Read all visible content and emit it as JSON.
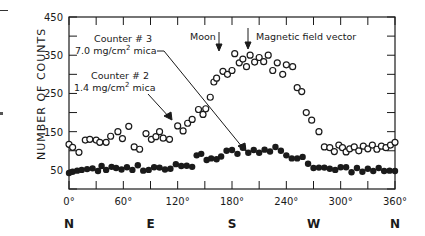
{
  "chart_data": {
    "type": "scatter",
    "title": "",
    "xlabel": "",
    "ylabel": "NUMBER OF COUNTS",
    "xlim": [
      0,
      360
    ],
    "ylim": [
      0,
      450
    ],
    "x_ticks": [
      "0°",
      "60°",
      "120°",
      "180°",
      "240°",
      "300°",
      "360°"
    ],
    "y_ticks": [
      "50",
      "150",
      "250",
      "350",
      "450"
    ],
    "compass_labels": [
      {
        "label": "N",
        "deg": 0
      },
      {
        "label": "E",
        "deg": 90
      },
      {
        "label": "S",
        "deg": 180
      },
      {
        "label": "W",
        "deg": 270
      },
      {
        "label": "N",
        "deg": 360
      }
    ],
    "grid": false,
    "series": [
      {
        "name": "Counter #2 1.4 mg/cm² mica",
        "marker": "open-circle",
        "x": [
          0,
          4,
          11,
          18,
          23,
          30,
          34,
          41,
          46,
          54,
          59,
          66,
          72,
          78,
          85,
          91,
          96,
          100,
          104,
          111,
          120,
          126,
          131,
          136,
          143,
          148,
          151,
          156,
          160,
          163,
          170,
          175,
          180,
          183,
          188,
          192,
          196,
          200,
          205,
          210,
          215,
          220,
          225,
          230,
          236,
          240,
          247,
          252,
          257,
          262,
          268,
          276,
          282,
          288,
          293,
          298,
          302,
          306,
          310,
          315,
          320,
          325,
          330,
          335,
          340,
          345,
          350,
          355,
          360
        ],
        "y": [
          117,
          109,
          96,
          128,
          130,
          128,
          122,
          122,
          138,
          150,
          132,
          164,
          110,
          104,
          145,
          130,
          137,
          150,
          133,
          130,
          165,
          152,
          172,
          182,
          208,
          195,
          210,
          240,
          280,
          290,
          308,
          300,
          310,
          354,
          330,
          340,
          320,
          350,
          332,
          344,
          333,
          350,
          310,
          330,
          300,
          325,
          320,
          265,
          255,
          200,
          180,
          150,
          110,
          108,
          98,
          115,
          108,
          97,
          105,
          110,
          100,
          112,
          105,
          115,
          104,
          112,
          108,
          115,
          122
        ]
      },
      {
        "name": "Counter #3 7.0 mg/cm² mica",
        "marker": "filled-circle",
        "x": [
          0,
          4,
          9,
          14,
          20,
          26,
          32,
          36,
          41,
          47,
          52,
          58,
          64,
          70,
          76,
          82,
          88,
          94,
          100,
          106,
          112,
          118,
          124,
          130,
          136,
          141,
          146,
          152,
          157,
          163,
          168,
          174,
          180,
          186,
          192,
          198,
          204,
          210,
          216,
          222,
          228,
          234,
          240,
          246,
          252,
          258,
          264,
          270,
          276,
          282,
          288,
          294,
          300,
          306,
          312,
          318,
          324,
          330,
          336,
          342,
          348,
          354,
          360
        ],
        "y": [
          42,
          45,
          48,
          50,
          52,
          54,
          47,
          60,
          50,
          58,
          55,
          51,
          57,
          50,
          62,
          48,
          50,
          57,
          56,
          51,
          53,
          65,
          60,
          61,
          58,
          88,
          92,
          76,
          80,
          78,
          85,
          100,
          102,
          92,
          108,
          95,
          102,
          95,
          103,
          98,
          110,
          100,
          88,
          80,
          80,
          84,
          66,
          55,
          56,
          56,
          53,
          50,
          57,
          57,
          44,
          55,
          45,
          53,
          47,
          55,
          47,
          48,
          47
        ]
      }
    ],
    "annotations": [
      {
        "text": "Counter # 3",
        "line2": "7.0 mg/cm² mica",
        "points_to_deg": 192
      },
      {
        "text": "Counter # 2",
        "line2": "1.4 mg/cm² mica",
        "points_to_deg": 120
      },
      {
        "text": "Moon",
        "arrow_deg": 165
      },
      {
        "text": "Magnetic field vector",
        "arrow_deg": 195
      }
    ]
  },
  "labels": {
    "ylabel": "NUMBER OF COUNTS",
    "c3_line1": "Counter # 3",
    "c3_line2a": "7.0 mg/cm",
    "c3_sup": "2",
    "c3_line2b": " mica",
    "c2_line1": "Counter # 2",
    "c2_line2a": "1.4 mg/cm",
    "c2_sup": "2",
    "c2_line2b": " mica",
    "moon": "Moon",
    "mag": "Magnetic field vector"
  }
}
